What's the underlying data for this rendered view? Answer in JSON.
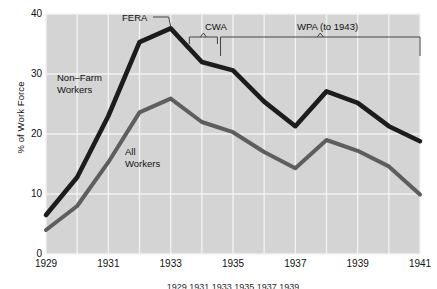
{
  "chart_data": {
    "type": "line",
    "title": "",
    "xlabel": "",
    "ylabel": "% of Work Force",
    "xlim": [
      1929,
      1941
    ],
    "ylim": [
      0,
      40
    ],
    "grid": true,
    "legend_position": "inline-labels",
    "x": [
      1929,
      1930,
      1931,
      1932,
      1933,
      1934,
      1935,
      1936,
      1937,
      1938,
      1939,
      1940,
      1941
    ],
    "yticks": [
      0,
      10,
      20,
      30,
      40
    ],
    "xticks": [
      1929,
      1931,
      1933,
      1935,
      1937,
      1939,
      1941
    ],
    "xtick_labels": [
      "1929",
      "1931",
      "1933",
      "1935",
      "1937",
      "1939",
      "1941"
    ],
    "series": [
      {
        "name": "Non-Farm Workers",
        "color": "#1c1c1c",
        "width": 4.6,
        "values": [
          6.5,
          12.8,
          23.0,
          35.3,
          37.6,
          32.0,
          30.6,
          25.4,
          21.3,
          27.1,
          25.2,
          21.3,
          18.8
        ]
      },
      {
        "name": "All Workers",
        "color": "#5e5e5e",
        "width": 4.0,
        "values": [
          4.0,
          8.0,
          15.3,
          23.6,
          25.9,
          22.0,
          20.3,
          17.0,
          14.3,
          19.0,
          17.2,
          14.6,
          9.9
        ]
      }
    ],
    "annotations": [
      {
        "name": "FERA",
        "label": "FERA",
        "type": "leader",
        "x": 1932.1,
        "points_to_year": 1933,
        "points_to_value": 37.6
      },
      {
        "name": "CWA",
        "label": "CWA",
        "type": "bracket",
        "start_year": 1933.6,
        "end_year": 1934.5
      },
      {
        "name": "WPA",
        "label": "WPA (to 1943)",
        "type": "bracket",
        "start_year": 1934.6,
        "end_year": 1941
      }
    ],
    "series_labels": [
      {
        "name": "Non-Farm Workers",
        "line1": "Non–Farm",
        "line2": "Workers"
      },
      {
        "name": "All Workers",
        "line1": "All",
        "line2": "Workers"
      }
    ],
    "colors": {
      "plot_background": "#d4d4d4",
      "gridline": "#f2f2f2",
      "page_background": "#ffffff",
      "text": "#111111",
      "nonfarm_line": "#1c1c1c",
      "allworkers_line": "#5e5e5e",
      "annotation_line": "#444444"
    }
  },
  "caption": {
    "text": "1929 1931 1933 1935 1937 1939"
  }
}
